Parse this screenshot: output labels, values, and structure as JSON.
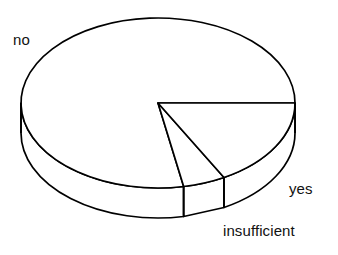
{
  "chart_data": {
    "type": "pie",
    "title": "",
    "subtitle": "",
    "xlabel": "",
    "ylabel": "",
    "style": "3d-exploded-pie",
    "grid": false,
    "legend_position": "none",
    "labels_position": "outside",
    "categories": [
      "no",
      "yes",
      "insufficient"
    ],
    "values": [
      78,
      17,
      5
    ],
    "units": "percent",
    "slice_angles_deg": [
      280.8,
      61.2,
      18.0
    ],
    "series": [
      {
        "name": "response",
        "values": [
          78,
          17,
          5
        ]
      }
    ],
    "annotations": [],
    "colors": {
      "outline": "#000000",
      "fill": "#ffffff",
      "background": "#ffffff"
    }
  },
  "labels": {
    "no": "no",
    "yes": "yes",
    "insufficient": "insufficient"
  },
  "geometry": {
    "center_x": 158,
    "center_y": 103,
    "radius_x": 137,
    "radius_y": 85,
    "depth": 30,
    "start_angle_deg": 0,
    "boundary_1_deg": 61.2,
    "boundary_2_deg": 79.2
  }
}
